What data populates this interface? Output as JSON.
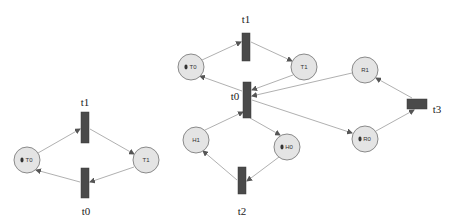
{
  "diagrams": [
    {
      "name": "left-net",
      "places": [
        {
          "id": "T0",
          "label": "T0",
          "token": true,
          "cx": 27,
          "cy": 160,
          "r": 13
        },
        {
          "id": "T1",
          "label": "T1",
          "token": false,
          "cx": 146,
          "cy": 160,
          "r": 13
        }
      ],
      "transitions": [
        {
          "id": "t1",
          "label": "t1",
          "x": 81,
          "y": 112,
          "w": 8,
          "h": 31,
          "lx": 85,
          "ly": 103
        },
        {
          "id": "t0",
          "label": "t0",
          "x": 81,
          "y": 168,
          "w": 8,
          "h": 30,
          "lx": 86,
          "ly": 212
        }
      ],
      "arcs": [
        {
          "from": "T0",
          "to": "t1",
          "x1": 38,
          "y1": 153,
          "x2": 80,
          "y2": 129
        },
        {
          "from": "t1",
          "to": "T1",
          "x1": 90,
          "y1": 129,
          "x2": 134,
          "y2": 154
        },
        {
          "from": "T1",
          "to": "t0",
          "x1": 134,
          "y1": 167,
          "x2": 90,
          "y2": 182
        },
        {
          "from": "t0",
          "to": "T0",
          "x1": 80,
          "y1": 182,
          "x2": 36,
          "y2": 170
        }
      ]
    },
    {
      "name": "right-net",
      "places": [
        {
          "id": "T0",
          "label": "T0",
          "token": true,
          "cx": 191,
          "cy": 67,
          "r": 13
        },
        {
          "id": "T1",
          "label": "T1",
          "token": false,
          "cx": 304,
          "cy": 67,
          "r": 13
        },
        {
          "id": "H1",
          "label": "H1",
          "token": false,
          "cx": 196,
          "cy": 140,
          "r": 13
        },
        {
          "id": "H0",
          "label": "H0",
          "token": true,
          "cx": 287,
          "cy": 147,
          "r": 13
        },
        {
          "id": "R1",
          "label": "R1",
          "token": false,
          "cx": 365,
          "cy": 70,
          "r": 13
        },
        {
          "id": "R0",
          "label": "R0",
          "token": true,
          "cx": 365,
          "cy": 139,
          "r": 13
        }
      ],
      "transitions": [
        {
          "id": "t1",
          "label": "t1",
          "x": 242,
          "y": 33,
          "w": 8,
          "h": 28,
          "lx": 246,
          "ly": 20
        },
        {
          "id": "t0",
          "label": "t0",
          "x": 243,
          "y": 82,
          "w": 8,
          "h": 36,
          "lx": 235,
          "ly": 97
        },
        {
          "id": "t2",
          "label": "t2",
          "x": 238,
          "y": 167,
          "w": 8,
          "h": 27,
          "lx": 242,
          "ly": 212
        },
        {
          "id": "t3",
          "label": "t3",
          "x": 407,
          "y": 99,
          "w": 20,
          "h": 10,
          "lx": 437,
          "ly": 110
        }
      ],
      "arcs": [
        {
          "from": "T0",
          "to": "t1",
          "x1": 202,
          "y1": 60,
          "x2": 241,
          "y2": 42
        },
        {
          "from": "t1",
          "to": "T1",
          "x1": 251,
          "y1": 42,
          "x2": 292,
          "y2": 61
        },
        {
          "from": "T1",
          "to": "t0",
          "x1": 293,
          "y1": 75,
          "x2": 252,
          "y2": 90
        },
        {
          "from": "t0",
          "to": "T0",
          "x1": 242,
          "y1": 91,
          "x2": 200,
          "y2": 76
        },
        {
          "from": "t0",
          "to": "H0",
          "x1": 250,
          "y1": 118,
          "x2": 280,
          "y2": 135
        },
        {
          "from": "H1",
          "to": "t0",
          "x1": 205,
          "y1": 130,
          "x2": 243,
          "y2": 112
        },
        {
          "from": "H0",
          "to": "t2",
          "x1": 279,
          "y1": 157,
          "x2": 247,
          "y2": 181
        },
        {
          "from": "t2",
          "to": "H1",
          "x1": 237,
          "y1": 180,
          "x2": 203,
          "y2": 151
        },
        {
          "from": "R1",
          "to": "t0",
          "x1": 352,
          "y1": 73,
          "x2": 252,
          "y2": 96
        },
        {
          "from": "t0",
          "to": "R0",
          "x1": 252,
          "y1": 100,
          "x2": 352,
          "y2": 133
        },
        {
          "from": "R0",
          "to": "t3",
          "x1": 376,
          "y1": 131,
          "x2": 414,
          "y2": 110
        },
        {
          "from": "t3",
          "to": "R1",
          "x1": 412,
          "y1": 98,
          "x2": 376,
          "y2": 78
        }
      ]
    }
  ],
  "colors": {
    "place_fill": "#e4e4e4",
    "place_stroke": "#8a8a8a",
    "transition_fill": "#4a4a4a",
    "arc": "#9c9c9c",
    "token": "#333333"
  }
}
